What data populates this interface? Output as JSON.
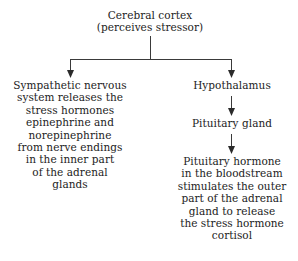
{
  "diagram": {
    "background_color": "#ffffff",
    "text_color": "#1c1c1c",
    "connector_color": "#3a3a3a",
    "nodes": {
      "root": "Cerebral cortex\n(perceives stressor)",
      "sympathetic": "Sympathetic nervous\nsystem releases the\nstress hormones\nepinephrine and\nnorepinephrine\nfrom nerve endings\nin the inner part\nof the adrenal\nglands",
      "hypothalamus": "Hypothalamus",
      "pituitary_gland": "Pituitary gland",
      "pituitary_hormone": "Pituitary hormone\nin the bloodstream\nstimulates the outer\npart of the adrenal\ngland to release\nthe stress hormone\ncortisol"
    },
    "edges": [
      {
        "from": "root",
        "to": "sympathetic"
      },
      {
        "from": "root",
        "to": "hypothalamus"
      },
      {
        "from": "hypothalamus",
        "to": "pituitary_gland"
      },
      {
        "from": "pituitary_gland",
        "to": "pituitary_hormone"
      }
    ]
  }
}
